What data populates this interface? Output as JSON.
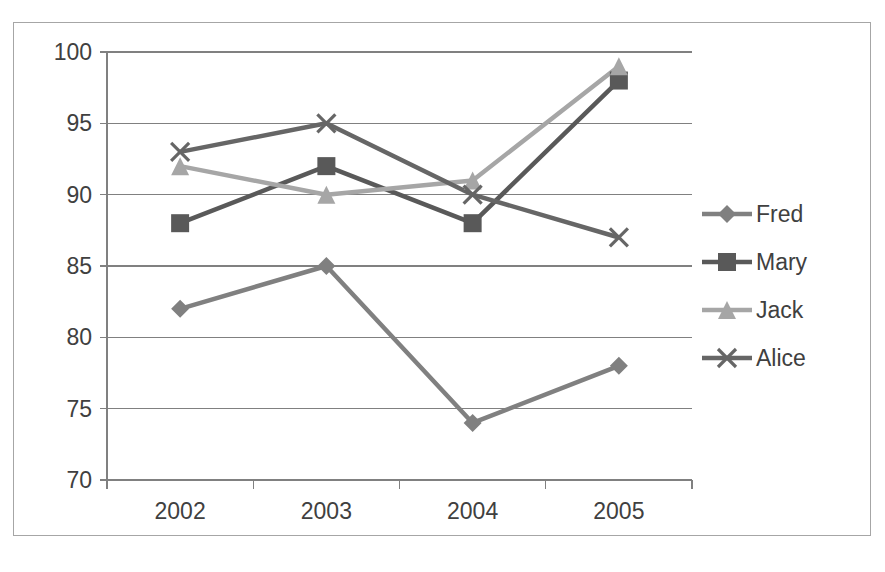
{
  "chart_data": {
    "type": "line",
    "title": "",
    "xlabel": "",
    "ylabel": "",
    "categories": [
      "2002",
      "2003",
      "2004",
      "2005"
    ],
    "ylim": [
      70,
      100
    ],
    "yticks": [
      70,
      75,
      80,
      85,
      90,
      95,
      100
    ],
    "grid": true,
    "legend_position": "right",
    "series": [
      {
        "name": "Fred",
        "marker": "diamond",
        "color": "#808080",
        "values": [
          82,
          85,
          74,
          78
        ]
      },
      {
        "name": "Mary",
        "marker": "square",
        "color": "#595959",
        "values": [
          88,
          92,
          88,
          98
        ]
      },
      {
        "name": "Jack",
        "marker": "triangle",
        "color": "#a6a6a6",
        "values": [
          92,
          90,
          91,
          99
        ]
      },
      {
        "name": "Alice",
        "marker": "x",
        "color": "#666666",
        "values": [
          93,
          95,
          90,
          87
        ]
      }
    ]
  },
  "axis": {
    "y_tick_labels": [
      "100",
      "95",
      "90",
      "85",
      "80",
      "75",
      "70"
    ],
    "x_tick_labels": [
      "2002",
      "2003",
      "2004",
      "2005"
    ]
  },
  "legend": {
    "items": [
      {
        "label": "Fred",
        "icon": "diamond-marker-icon"
      },
      {
        "label": "Mary",
        "icon": "square-marker-icon"
      },
      {
        "label": "Jack",
        "icon": "triangle-marker-icon"
      },
      {
        "label": "Alice",
        "icon": "x-marker-icon"
      }
    ]
  },
  "colors": {
    "frame_border": "#a6a6a6",
    "gridline": "#808080",
    "axis_line": "#808080",
    "text": "#404040"
  }
}
